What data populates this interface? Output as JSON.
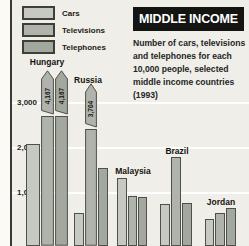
{
  "colors": {
    "background": "#efeee9",
    "header_bg": "#141413",
    "header_text": "#ffffff",
    "gridline": "#ffffff",
    "bar_border": "#50504a",
    "axis_line": "#3a3a33",
    "text": "#1c1b16"
  },
  "chart_data": {
    "type": "bar",
    "title": "MIDDLE INCOME",
    "subtitle_lines": [
      "Number of cars, televisions",
      "and telephones for each",
      "10,000 people, selected",
      "middle income countries",
      "(1993)"
    ],
    "legend": [
      "Cars",
      "Televisions",
      "Telephones"
    ],
    "legend_position": "top-left",
    "grid": true,
    "axis_break": true,
    "yticks": [
      "3,000",
      "2,000",
      "1,000"
    ],
    "ytick_values": [
      3000,
      2000,
      1000
    ],
    "ylim": [
      0,
      3000
    ],
    "categories": [
      "Hungary",
      "Russia",
      "Malaysia",
      "Brazil",
      "Jordan"
    ],
    "series": [
      {
        "name": "Cars",
        "color": "#c6c9c1",
        "values": [
          2100,
          550,
          1330,
          750,
          420
        ],
        "value_labels": [
          null,
          null,
          null,
          null,
          null
        ]
      },
      {
        "name": "Televisions",
        "color": "#afb3ab",
        "values": [
          4167,
          3704,
          930,
          1800,
          550
        ],
        "value_labels": [
          "4,167",
          "3,704",
          null,
          null,
          null
        ]
      },
      {
        "name": "Telephones",
        "color": "#a3a89f",
        "values": [
          4167,
          1550,
          910,
          780,
          670
        ],
        "value_labels": [
          "4,167",
          null,
          null,
          null,
          null
        ]
      }
    ]
  }
}
